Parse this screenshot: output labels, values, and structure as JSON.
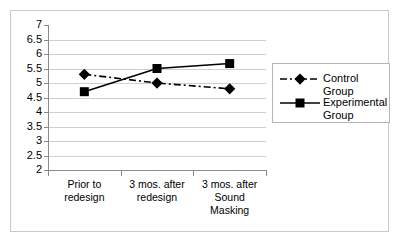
{
  "chart_data": {
    "type": "line",
    "title": "",
    "xlabel": "",
    "ylabel": "",
    "ylim": [
      2,
      7
    ],
    "ytick_step": 0.5,
    "yticks": [
      "7",
      "6.5",
      "6",
      "5.5",
      "5",
      "4.5",
      "4",
      "3.5",
      "3",
      "2.5",
      "2"
    ],
    "ytick_values": [
      7,
      6.5,
      6,
      5.5,
      5,
      4.5,
      4,
      3.5,
      3,
      2.5,
      2
    ],
    "grid": true,
    "legend_position": "right",
    "categories": [
      "Prior to\nredesign",
      "3 mos. after\nredesign",
      "3 mos. after\nSound\nMasking"
    ],
    "series": [
      {
        "name": "Control Group",
        "values": [
          5.3,
          5.0,
          4.8
        ],
        "marker": "diamond",
        "linestyle": "dash-dot",
        "color": "#000000"
      },
      {
        "name": "Experimental Group",
        "values": [
          4.7,
          5.5,
          5.67
        ],
        "marker": "square",
        "linestyle": "solid",
        "color": "#000000"
      }
    ]
  },
  "legend": {
    "entries": [
      {
        "label": "Control Group",
        "marker": "diamond-marker-icon",
        "linestyle": "dash-dot"
      },
      {
        "label": "Experimental\nGroup",
        "marker": "square-marker-icon",
        "linestyle": "solid"
      }
    ]
  },
  "colors": {
    "series": "#000000",
    "gridline": "#d0d0d0",
    "axis": "#8a8a8a",
    "frame": "#c9c9c9",
    "legend_border": "#b5b5b5",
    "background": "#ffffff",
    "text": "#000000"
  }
}
